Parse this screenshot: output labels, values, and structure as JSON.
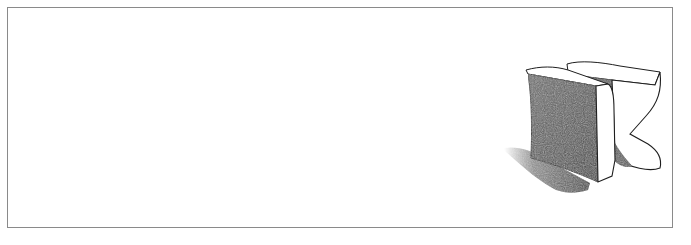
{
  "figure": {
    "letter": "K",
    "colors": {
      "background": "#ffffff",
      "frame_border": "#8a8a8a",
      "shade_dark": "#4a4a4a",
      "shade_mid": "#7a7a7a",
      "outline": "#1e1e1e",
      "face_light": "#ffffff"
    }
  }
}
